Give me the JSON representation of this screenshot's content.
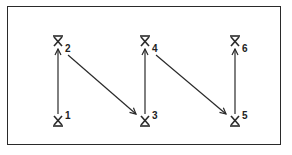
{
  "diagram": {
    "stroke_color": "#2a2a2a",
    "nodes": [
      {
        "id": "1",
        "label": "1",
        "x": 58,
        "y": 120,
        "glyph": "bar-bottom",
        "label_pos": "superscript"
      },
      {
        "id": "2",
        "label": "2",
        "x": 58,
        "y": 42,
        "glyph": "bar-top",
        "label_pos": "subscript"
      },
      {
        "id": "3",
        "label": "3",
        "x": 145,
        "y": 120,
        "glyph": "bar-bottom",
        "label_pos": "superscript"
      },
      {
        "id": "4",
        "label": "4",
        "x": 145,
        "y": 42,
        "glyph": "bar-top",
        "label_pos": "subscript"
      },
      {
        "id": "5",
        "label": "5",
        "x": 235,
        "y": 120,
        "glyph": "bar-bottom",
        "label_pos": "superscript"
      },
      {
        "id": "6",
        "label": "6",
        "x": 235,
        "y": 42,
        "glyph": "bar-top",
        "label_pos": "subscript"
      }
    ],
    "edges": [
      {
        "from": "1",
        "to": "2"
      },
      {
        "from": "2",
        "to": "3"
      },
      {
        "from": "3",
        "to": "4"
      },
      {
        "from": "4",
        "to": "5"
      },
      {
        "from": "5",
        "to": "6"
      }
    ]
  }
}
